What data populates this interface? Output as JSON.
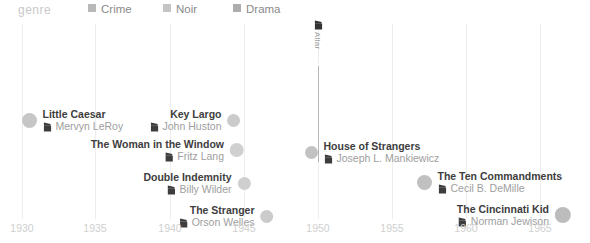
{
  "legend": {
    "title": "genre",
    "items": [
      {
        "label": "Crime",
        "color": "#b8b8b8",
        "x": 88
      },
      {
        "label": "Noir",
        "color": "#c4c4c4",
        "x": 163
      },
      {
        "label": "Drama",
        "color": "#adadad",
        "x": 233
      }
    ]
  },
  "axis": {
    "label": "",
    "ticks": [
      1930,
      1935,
      1940,
      1945,
      1950,
      1955,
      1960,
      1965
    ],
    "tick_x": [
      22,
      95,
      170,
      244,
      318,
      392,
      466,
      540
    ],
    "min": 1930,
    "max": 1965
  },
  "annotation": {
    "label": "Allar",
    "icon": "film-marker-icon",
    "x": 318,
    "top": 16,
    "line_top": 42,
    "line_height": 96
  },
  "chart_data": {
    "type": "scatter",
    "title": "",
    "xlabel": "",
    "ylabel": "",
    "xlim": [
      1930,
      1965
    ],
    "grid": true,
    "legend_position": "top",
    "categories": [
      "Crime",
      "Noir",
      "Drama"
    ],
    "points": [
      {
        "title": "Little Caesar",
        "director": "Mervyn LeRoy",
        "year": 1931,
        "genre": "Crime",
        "x": 29,
        "y": 96,
        "size": 15,
        "color": "#c6c6c6",
        "align": "left"
      },
      {
        "title": "Key Largo",
        "director": "John Huston",
        "year": 1948,
        "genre": "Noir",
        "x": 234,
        "y": 96,
        "size": 13,
        "color": "#cbcbcb",
        "align": "right"
      },
      {
        "title": "The Woman in the Window",
        "director": "Fritz Lang",
        "year": 1944,
        "genre": "Noir",
        "x": 237,
        "y": 126,
        "size": 14,
        "color": "#d0d0d0",
        "align": "right"
      },
      {
        "title": "House of Strangers",
        "director": "Joseph L. Mankiewicz",
        "year": 1949,
        "genre": "Noir",
        "x": 311,
        "y": 128,
        "size": 13,
        "color": "#c2c2c2",
        "align": "left"
      },
      {
        "title": "Double Indemnity",
        "director": "Billy Wilder",
        "year": 1944,
        "genre": "Noir",
        "x": 244,
        "y": 159,
        "size": 13,
        "color": "#cfcfcf",
        "align": "right"
      },
      {
        "title": "The Ten Commandments",
        "director": "Cecil B. DeMille",
        "year": 1956,
        "genre": "Drama",
        "x": 424,
        "y": 158,
        "size": 15,
        "color": "#c0c0c0",
        "align": "left"
      },
      {
        "title": "The Stranger",
        "director": "Orson Welles",
        "year": 1946,
        "genre": "Noir",
        "x": 267,
        "y": 192,
        "size": 13,
        "color": "#cbcbcb",
        "align": "right"
      },
      {
        "title": "The Cincinnati Kid",
        "director": "Norman Jewison",
        "year": 1965,
        "genre": "Drama",
        "x": 563,
        "y": 191,
        "size": 16,
        "color": "#bcbcbc",
        "align": "right"
      }
    ]
  }
}
